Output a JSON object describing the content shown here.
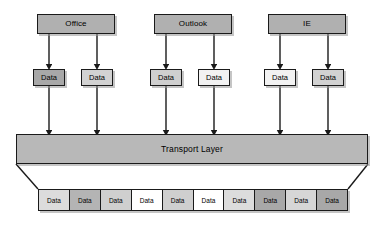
{
  "diagram": {
    "canvas": {
      "width": 384,
      "height": 225,
      "background": "#ffffff"
    },
    "palette": {
      "outline": "#1a1a1a",
      "shadow": "#969696",
      "app_fill": "#b0b0b0",
      "transport_fill": "#b8b8b8",
      "gray_dark": "#a0a0a0",
      "gray_medium": "#bdbdbd",
      "gray_light": "#d6d6d6",
      "gray_pale": "#e8e8e8",
      "white": "#ffffff"
    },
    "applications": [
      {
        "label": "Office",
        "fill": "#b0b0b0",
        "x": 37,
        "y": 14,
        "w": 78
      },
      {
        "label": "Outlook",
        "fill": "#b0b0b0",
        "x": 154,
        "y": 14,
        "w": 78
      },
      {
        "label": "IE",
        "fill": "#b0b0b0",
        "x": 268,
        "y": 14,
        "w": 78
      }
    ],
    "data_packets": [
      {
        "label": "Data",
        "fill": "#a8a8a8",
        "x": 33,
        "y": 69,
        "w": 32
      },
      {
        "label": "Data",
        "fill": "#d2d2d2",
        "x": 81,
        "y": 69,
        "w": 32
      },
      {
        "label": "Data",
        "fill": "#cfcfcf",
        "x": 150,
        "y": 69,
        "w": 32
      },
      {
        "label": "Data",
        "fill": "#f2f2f2",
        "x": 198,
        "y": 69,
        "w": 32
      },
      {
        "label": "Data",
        "fill": "#f2f2f2",
        "x": 264,
        "y": 69,
        "w": 32
      },
      {
        "label": "Data",
        "fill": "#d2d2d2",
        "x": 312,
        "y": 69,
        "w": 32
      }
    ],
    "transport_layer": {
      "label": "Transport Layer",
      "fill": "#b8b8b8",
      "x": 16,
      "y": 134,
      "w": 352,
      "h": 30
    },
    "funnel": {
      "left_top_x": 16,
      "right_top_x": 368,
      "top_y": 164,
      "left_bottom_x": 38,
      "right_bottom_x": 348,
      "bottom_y": 189
    },
    "output_strip": {
      "x": 38,
      "y": 189,
      "w": 310,
      "h": 22,
      "cells": [
        {
          "label": "Data",
          "fill": "#dcdcdc"
        },
        {
          "label": "Data",
          "fill": "#b4b4b4"
        },
        {
          "label": "Data",
          "fill": "#cfcfcf"
        },
        {
          "label": "Data",
          "fill": "#ffffff"
        },
        {
          "label": "Data",
          "fill": "#cfcfcf"
        },
        {
          "label": "Data",
          "fill": "#ffffff"
        },
        {
          "label": "Data",
          "fill": "#dcdcdc"
        },
        {
          "label": "Data",
          "fill": "#a8a8a8"
        },
        {
          "label": "Data",
          "fill": "#d6d6d6"
        },
        {
          "label": "Data",
          "fill": "#a8a8a8"
        }
      ]
    },
    "arrows": {
      "app_to_packet": [
        {
          "from_x": 49,
          "from_y": 34,
          "to_x": 49,
          "to_y": 67
        },
        {
          "from_x": 97,
          "from_y": 34,
          "to_x": 97,
          "to_y": 67
        },
        {
          "from_x": 166,
          "from_y": 34,
          "to_x": 166,
          "to_y": 67
        },
        {
          "from_x": 214,
          "from_y": 34,
          "to_x": 214,
          "to_y": 67
        },
        {
          "from_x": 280,
          "from_y": 34,
          "to_x": 280,
          "to_y": 67
        },
        {
          "from_x": 328,
          "from_y": 34,
          "to_x": 328,
          "to_y": 67
        }
      ],
      "packet_to_transport": [
        {
          "from_x": 49,
          "from_y": 86,
          "to_x": 49,
          "to_y": 133
        },
        {
          "from_x": 97,
          "from_y": 86,
          "to_x": 97,
          "to_y": 133
        },
        {
          "from_x": 166,
          "from_y": 86,
          "to_x": 166,
          "to_y": 133
        },
        {
          "from_x": 214,
          "from_y": 86,
          "to_x": 214,
          "to_y": 133
        },
        {
          "from_x": 280,
          "from_y": 86,
          "to_x": 280,
          "to_y": 133
        },
        {
          "from_x": 328,
          "from_y": 86,
          "to_x": 328,
          "to_y": 133
        }
      ]
    }
  }
}
